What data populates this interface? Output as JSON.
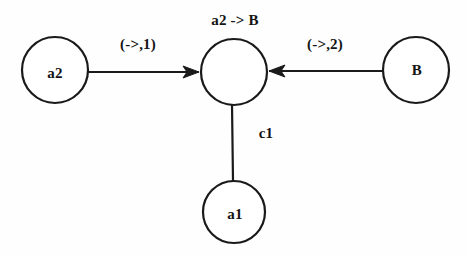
{
  "diagram": {
    "type": "graph",
    "background_color": "#fefefe",
    "stroke_color": "#1a1a1a",
    "nodes": [
      {
        "id": "a2",
        "label": "a2",
        "cx": 55,
        "cy": 70,
        "r": 33
      },
      {
        "id": "center",
        "label": "",
        "cx": 234,
        "cy": 72,
        "r": 33
      },
      {
        "id": "b",
        "label": "B",
        "cx": 416,
        "cy": 70,
        "r": 33
      },
      {
        "id": "a1",
        "label": "a1",
        "cx": 234,
        "cy": 212,
        "r": 31
      }
    ],
    "edges": [
      {
        "id": "a2-to-center",
        "from": "a2",
        "to": "center",
        "label": "(->,1)",
        "directed": true,
        "direction": "right"
      },
      {
        "id": "b-to-center",
        "from": "b",
        "to": "center",
        "label": "(->,2)",
        "directed": true,
        "direction": "left"
      },
      {
        "id": "center-to-a1",
        "from": "center",
        "to": "a1",
        "label": "c1",
        "directed": false,
        "direction": "none"
      }
    ],
    "annotations": [
      {
        "id": "center-node-caption",
        "text": "a2 -> B"
      }
    ]
  }
}
